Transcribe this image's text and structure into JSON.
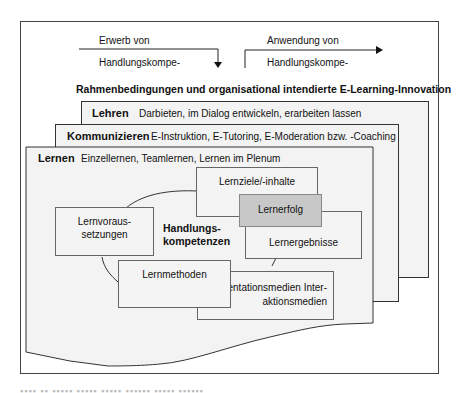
{
  "flow": {
    "left_label_line1": "Erwerb von",
    "left_label_line2": "Handlungskompe-",
    "right_label_line1": "Anwendung von",
    "right_label_line2": "Handlungskompe-"
  },
  "frame_title": "Rahmenbedingungen und organisational intendierte E-Learning-Innovation",
  "layers": [
    {
      "title": "Lehren",
      "description": "Darbieten, im Dialog entwickeln, erarbeiten lassen"
    },
    {
      "title": "Kommunizieren",
      "description": "E-Instruktion, E-Tutoring, E-Moderation bzw. -Coaching"
    },
    {
      "title": "Lernen",
      "description": "Einzellernen, Teamlernen, Lernen im Plenum"
    }
  ],
  "center": {
    "line1": "Handlungs-",
    "line2": "kompetenzen"
  },
  "boxes": {
    "lernziele": "Lernziele/-inhalte",
    "lernerfolg": "Lernerfolg",
    "lernergebnisse": "Lernergebnisse",
    "lernvoraus_line1": "Lernvoraus-",
    "lernvoraus_line2": "setzungen",
    "lernmethoden": "Lernmethoden",
    "medien_line1": "sentationsmedien Inter-",
    "medien_line2": "aktionsmedien"
  },
  "colors": {
    "highlight_box": "#c8c8c8",
    "layer_fill": "#f3f3f3",
    "border": "#333333"
  }
}
